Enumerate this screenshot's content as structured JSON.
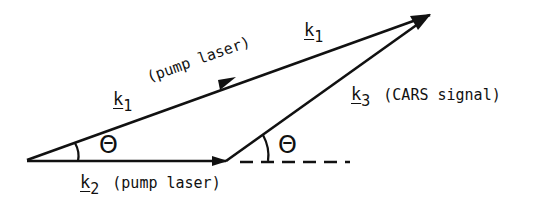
{
  "diagram": {
    "vectors": [
      {
        "id": "k1",
        "symbol": "k",
        "subscript": "1",
        "description": "(pump laser)"
      },
      {
        "id": "k2",
        "symbol": "k",
        "subscript": "2",
        "description": "(pump laser)"
      },
      {
        "id": "k3",
        "symbol": "k",
        "subscript": "3",
        "description": "(CARS signal)"
      }
    ],
    "labels": {
      "k1_top_symbol": "k",
      "k1_top_sub": "1",
      "k1_mid_symbol": "k",
      "k1_mid_sub": "1",
      "k1_desc": "(pump laser)",
      "k2_symbol": "k",
      "k2_sub": "2",
      "k2_desc": "(pump laser)",
      "k3_symbol": "k",
      "k3_sub": "3",
      "k3_desc": "(CARS signal)",
      "angle_left": "Θ",
      "angle_right": "Θ"
    },
    "stroke_color": "#111111"
  }
}
